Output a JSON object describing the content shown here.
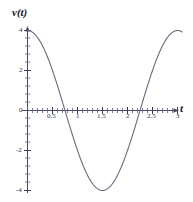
{
  "chart_data": {
    "type": "line",
    "title": "",
    "subtitle": "",
    "xlabel": "t",
    "ylabel": "v(t)",
    "xlim": [
      0,
      3.1
    ],
    "ylim": [
      -4.6,
      4.6
    ],
    "grid": false,
    "legend": null,
    "xticks": [
      {
        "value": 0.5,
        "label": "0.5"
      },
      {
        "value": 1,
        "label": "1"
      },
      {
        "value": 1.5,
        "label": "1.5"
      },
      {
        "value": 2,
        "label": "2"
      },
      {
        "value": 2.5,
        "label": "2.5"
      },
      {
        "value": 3,
        "label": "3"
      }
    ],
    "yticks": [
      {
        "value": 4,
        "label": "4"
      },
      {
        "value": 2,
        "label": "2"
      },
      {
        "value": 0,
        "label": "0"
      },
      {
        "value": -2,
        "label": "-2"
      },
      {
        "value": -4,
        "label": "-4"
      }
    ],
    "minor_tick_step_x": 0.1,
    "minor_tick_step_y": 0.4,
    "series": [
      {
        "name": "v(t)",
        "expression": "4*cos(2*pi*t/3)",
        "amplitude": 4,
        "period": 3,
        "color": "#6b6b80",
        "x": [
          0,
          0.1,
          0.2,
          0.3,
          0.4,
          0.5,
          0.6,
          0.7,
          0.75,
          0.8,
          0.9,
          1.0,
          1.1,
          1.2,
          1.3,
          1.4,
          1.5,
          1.6,
          1.7,
          1.8,
          1.9,
          2.0,
          2.1,
          2.2,
          2.25,
          2.3,
          2.4,
          2.5,
          2.6,
          2.7,
          2.8,
          2.9,
          3.0
        ],
        "values": [
          4.0,
          3.91,
          3.65,
          3.24,
          2.69,
          2.0,
          1.24,
          0.42,
          0.0,
          -0.42,
          -1.24,
          -2.0,
          -2.69,
          -3.24,
          -3.65,
          -3.91,
          -4.0,
          -3.91,
          -3.65,
          -3.24,
          -2.69,
          -2.0,
          -1.24,
          -0.42,
          0.0,
          0.42,
          1.24,
          2.0,
          2.69,
          3.24,
          3.65,
          3.91,
          4.0
        ]
      }
    ],
    "features": {
      "max_value": 4,
      "min_value": -4,
      "minimum_at_t": 1.5,
      "zero_crossings": [
        0.75,
        2.25
      ]
    }
  }
}
